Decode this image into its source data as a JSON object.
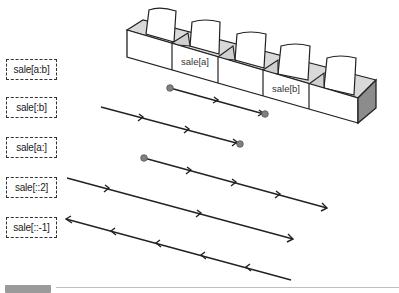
{
  "diagram": {
    "colors": {
      "stroke": "#222222",
      "box_face": "#ffffff",
      "box_inner_shade": "#d9d9d9",
      "box_end_shade": "#8c8c8c",
      "endpoint_dot": "#808080",
      "label_border": "#333333"
    },
    "cells": {
      "count": 5,
      "labels": [
        {
          "index": 1,
          "text": "sale[a]"
        },
        {
          "index": 3,
          "text": "sale[b]"
        }
      ]
    },
    "slices": [
      {
        "label": "sale[a:b]",
        "direction": "forward",
        "start": "a (dot)",
        "end": "b (dot)",
        "arrow_marks": 1
      },
      {
        "label": "sale[:b]",
        "direction": "forward",
        "start": "beginning",
        "end": "b (dot)",
        "arrow_marks": 2
      },
      {
        "label": "sale[a:]",
        "direction": "forward",
        "start": "a (dot)",
        "end": "end (arrowhead)",
        "arrow_marks": 3
      },
      {
        "label": "sale[::2]",
        "direction": "forward",
        "start": "beginning",
        "end": "end (arrowhead)",
        "arrow_marks": 2
      },
      {
        "label": "sale[::-1]",
        "direction": "backward",
        "start": "end",
        "end": "beginning (arrowhead)",
        "arrow_marks": 4
      }
    ]
  },
  "labels": {
    "slice_1": "sale[a:b]",
    "slice_2": "sale[:b]",
    "slice_3": "sale[a:]",
    "slice_4": "sale[::2]",
    "slice_5": "sale[::-1]",
    "cell_a": "sale[a]",
    "cell_b": "sale[b]"
  }
}
